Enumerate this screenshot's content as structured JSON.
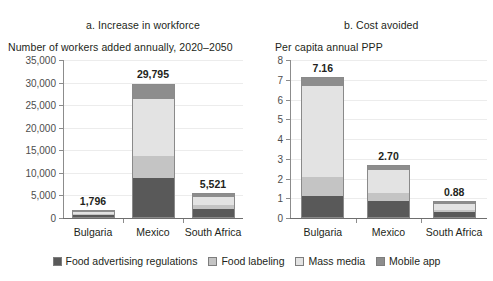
{
  "figure": {
    "panels": [
      {
        "id": "a",
        "title": "a. Increase in workforce",
        "subtitle": "Number of workers added annually, 2020–2050"
      },
      {
        "id": "b",
        "title": "b. Cost avoided",
        "subtitle": "Per capita annual PPP"
      }
    ]
  },
  "legend": {
    "items": [
      {
        "label": "Food advertising regulations",
        "color": "#595959"
      },
      {
        "label": "Food labeling",
        "color": "#c4c4c4"
      },
      {
        "label": "Mass media",
        "color": "#e3e3e3"
      },
      {
        "label": "Mobile app",
        "color": "#8d8d8d"
      }
    ]
  },
  "chart_data": [
    {
      "type": "bar",
      "subtype": "stacked",
      "panel": "a",
      "title": "a. Increase in workforce",
      "subtitle": "Number of workers added annually, 2020–2050",
      "xlabel": "",
      "ylabel": "Number of workers added annually, 2020–2050",
      "categories": [
        "Bulgaria",
        "Mexico",
        "South Africa"
      ],
      "ylim": [
        0,
        35000
      ],
      "yticks": [
        0,
        5000,
        10000,
        15000,
        20000,
        25000,
        30000,
        35000
      ],
      "ytick_labels": [
        "0",
        "5,000",
        "10,000",
        "15,000",
        "20,000",
        "25,000",
        "30,000",
        "35,000"
      ],
      "grid": true,
      "legend_position": "bottom",
      "series": [
        {
          "name": "Food advertising regulations",
          "color": "#595959",
          "values": [
            520,
            8700,
            1950
          ]
        },
        {
          "name": "Food labeling",
          "color": "#c4c4c4",
          "values": [
            430,
            5000,
            900
          ]
        },
        {
          "name": "Mass media",
          "color": "#e3e3e3",
          "values": [
            640,
            12800,
            1930
          ]
        },
        {
          "name": "Mobile app",
          "color": "#8d8d8d",
          "values": [
            206,
            3295,
            741
          ]
        }
      ],
      "totals": [
        1796,
        29795,
        5521
      ],
      "total_labels": [
        "1,796",
        "29,795",
        "5,521"
      ]
    },
    {
      "type": "bar",
      "subtype": "stacked",
      "panel": "b",
      "title": "b. Cost avoided",
      "subtitle": "Per capita annual PPP",
      "xlabel": "",
      "ylabel": "Per capita annual PPP",
      "categories": [
        "Bulgaria",
        "Mexico",
        "South Africa"
      ],
      "ylim": [
        0,
        8
      ],
      "yticks": [
        0,
        1,
        2,
        3,
        4,
        5,
        6,
        7,
        8
      ],
      "ytick_labels": [
        "0",
        "1",
        "2",
        "3",
        "4",
        "5",
        "6",
        "7",
        "8"
      ],
      "grid": true,
      "legend_position": "bottom",
      "series": [
        {
          "name": "Food advertising regulations",
          "color": "#595959",
          "values": [
            1.08,
            0.84,
            0.27
          ]
        },
        {
          "name": "Food labeling",
          "color": "#c4c4c4",
          "values": [
            0.96,
            0.44,
            0.13
          ]
        },
        {
          "name": "Mass media",
          "color": "#e3e3e3",
          "values": [
            4.68,
            1.17,
            0.33
          ]
        },
        {
          "name": "Mobile app",
          "color": "#8d8d8d",
          "values": [
            0.44,
            0.25,
            0.15
          ]
        }
      ],
      "totals": [
        7.16,
        2.7,
        0.88
      ],
      "total_labels": [
        "7.16",
        "2.70",
        "0.88"
      ]
    }
  ]
}
